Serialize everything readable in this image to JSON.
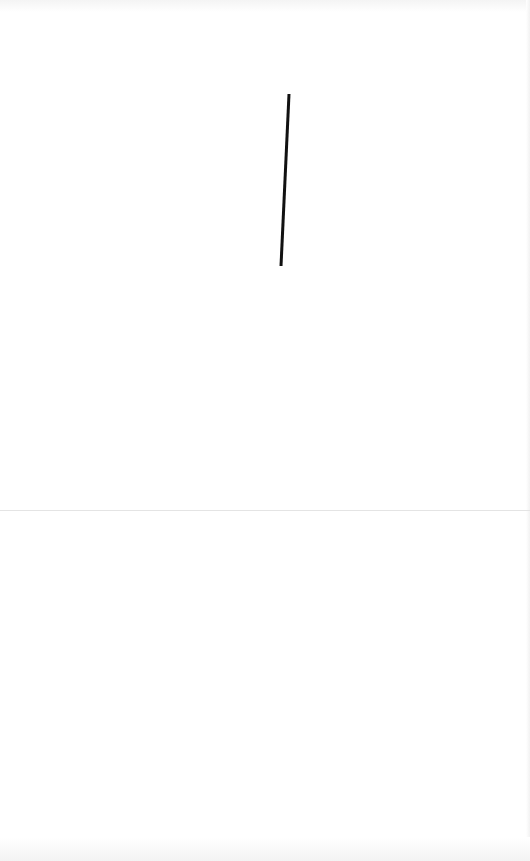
{
  "canvas": {
    "background": "#ffffff",
    "strokes": [
      {
        "color": "#111111",
        "width": 3,
        "points": [
          [
            289,
            94
          ],
          [
            281,
            266
          ]
        ]
      }
    ]
  },
  "divider": {
    "y": 510,
    "color": "#e4e4e4"
  }
}
